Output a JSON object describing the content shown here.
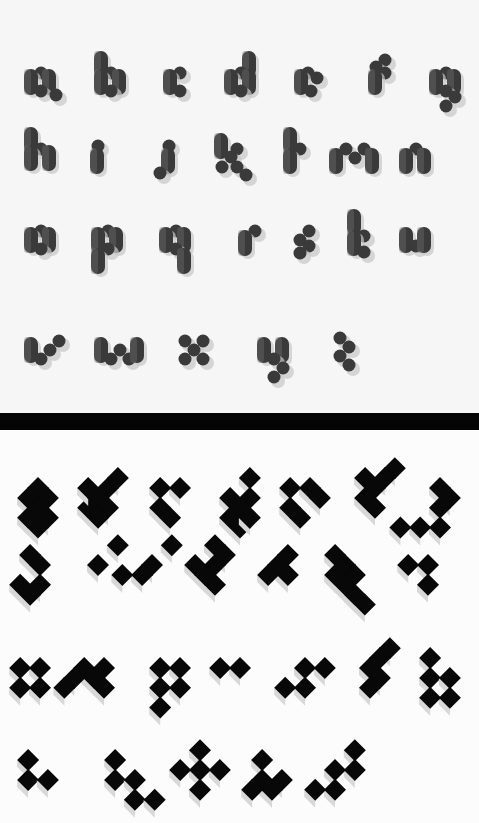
{
  "specimen": {
    "top_section": {
      "style": "rounded-pill-dots-with-shadow",
      "rows": [
        [
          "a",
          "b",
          "c",
          "d",
          "e",
          "f",
          "g"
        ],
        [
          "h",
          "i",
          "j",
          "k",
          "l",
          "m",
          "n"
        ],
        [
          "o",
          "p",
          "q",
          "r",
          "s",
          "t",
          "u"
        ],
        [
          "v",
          "w",
          "x",
          "y",
          "z"
        ]
      ],
      "colors": {
        "glyph": "#3a3a3a",
        "shadow": "#c8c8c8",
        "background": "#f6f6f6"
      }
    },
    "divider": {
      "color": "#050505"
    },
    "bottom_section": {
      "style": "isometric-block-letters",
      "rows": [
        [
          "a",
          "b",
          "c",
          "d",
          "e",
          "f",
          "g"
        ],
        [
          "h",
          "i",
          "j",
          "k",
          "l",
          "m",
          "n"
        ],
        [
          "o",
          "p",
          "q",
          "r",
          "s",
          "t",
          "u"
        ],
        [
          "v",
          "w",
          "x",
          "y",
          "z"
        ]
      ],
      "colors": {
        "glyph": "#080808",
        "side": "#d8d8d8",
        "background": "#fcfcfc"
      }
    }
  }
}
